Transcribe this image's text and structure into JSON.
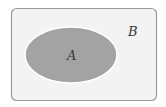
{
  "diagram": {
    "type": "venn-subset",
    "outer_set": {
      "label": "B",
      "fill": "#f3f3f3",
      "stroke": "#9a9a9a"
    },
    "inner_set": {
      "label": "A",
      "fill": "#a3a3a3",
      "stroke": "#ffffff"
    }
  }
}
